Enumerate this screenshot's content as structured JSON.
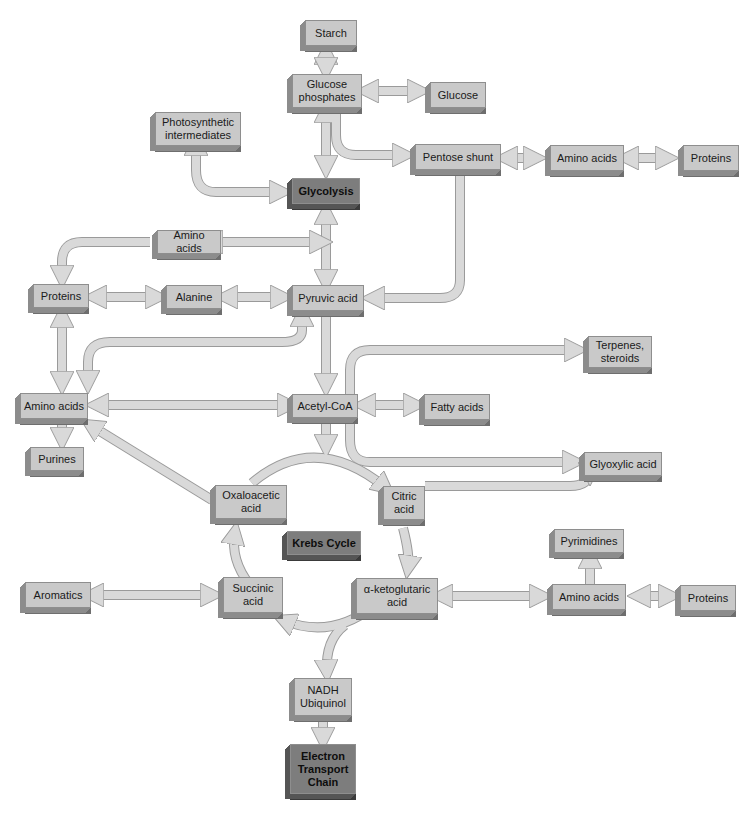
{
  "diagram": {
    "type": "metabolic-pathway-flowchart",
    "colors": {
      "box_fill": "#c9c9c9",
      "box_fill_highlight": "#7d7d7d",
      "arrow_fill": "#d9d9d9",
      "arrow_stroke": "#9a9a9a"
    },
    "nodes": {
      "starch": "Starch",
      "glucose_phosphates": "Glucose\nphosphates",
      "glucose": "Glucose",
      "photosynthetic_intermediates": "Photosynthetic\nintermediates",
      "glycolysis": "Glycolysis",
      "pentose_shunt": "Pentose shunt",
      "amino_acids_top": "Amino acids",
      "proteins_top": "Proteins",
      "amino_acids_mid": "Amino acids",
      "proteins_left": "Proteins",
      "alanine": "Alanine",
      "pyruvic_acid": "Pyruvic acid",
      "terpenes_steroids": "Terpenes,\nsteroids",
      "amino_acids_left": "Amino acids",
      "acetyl_coa": "Acetyl-CoA",
      "fatty_acids": "Fatty acids",
      "purines": "Purines",
      "glyoxylic_acid": "Glyoxylic acid",
      "oxaloacetic_acid": "Oxaloacetic\nacid",
      "citric_acid": "Citric\nacid",
      "krebs_cycle": "Krebs Cycle",
      "pyrimidines": "Pyrimidines",
      "aromatics": "Aromatics",
      "succinic_acid": "Succinic\nacid",
      "alpha_ketoglutaric_acid": "α-ketoglutaric\nacid",
      "amino_acids_right": "Amino acids",
      "proteins_right": "Proteins",
      "nadh_ubiquinol": "NADH\nUbiquinol",
      "electron_transport_chain": "Electron\nTransport\nChain"
    },
    "edges": [
      {
        "from": "Starch",
        "to": "Glucose phosphates",
        "dir": "both"
      },
      {
        "from": "Glucose phosphates",
        "to": "Glucose",
        "dir": "both"
      },
      {
        "from": "Glucose phosphates",
        "to": "Glycolysis",
        "dir": "both"
      },
      {
        "from": "Glucose phosphates",
        "to": "Pentose shunt",
        "dir": "forward"
      },
      {
        "from": "Photosynthetic intermediates",
        "to": "Glycolysis",
        "dir": "both"
      },
      {
        "from": "Pentose shunt",
        "to": "Amino acids",
        "dir": "both"
      },
      {
        "from": "Amino acids",
        "to": "Proteins",
        "dir": "both"
      },
      {
        "from": "Pentose shunt",
        "to": "Pyruvic acid",
        "dir": "forward"
      },
      {
        "from": "Glycolysis",
        "to": "Pyruvic acid",
        "dir": "both"
      },
      {
        "from": "Amino acids (mid)",
        "to": "Glycolysis/Pyruvic axis",
        "dir": "both"
      },
      {
        "from": "Amino acids (mid)",
        "to": "Proteins (left)",
        "dir": "forward"
      },
      {
        "from": "Proteins (left)",
        "to": "Alanine",
        "dir": "both"
      },
      {
        "from": "Alanine",
        "to": "Pyruvic acid",
        "dir": "both"
      },
      {
        "from": "Proteins (left)",
        "to": "Amino acids (left)",
        "dir": "both"
      },
      {
        "from": "Pyruvic acid",
        "to": "Amino acids (left)",
        "dir": "both"
      },
      {
        "from": "Pyruvic acid",
        "to": "Acetyl-CoA",
        "dir": "forward"
      },
      {
        "from": "Acetyl-CoA",
        "to": "Amino acids (left)",
        "dir": "both"
      },
      {
        "from": "Acetyl-CoA",
        "to": "Fatty acids",
        "dir": "both"
      },
      {
        "from": "Acetyl-CoA",
        "to": "Terpenes, steroids",
        "dir": "forward"
      },
      {
        "from": "Acetyl-CoA",
        "to": "Glyoxylic acid",
        "dir": "forward"
      },
      {
        "from": "Amino acids (left)",
        "to": "Purines",
        "dir": "forward"
      },
      {
        "from": "Oxaloacetic acid",
        "to": "Amino acids (left)",
        "dir": "forward"
      },
      {
        "from": "Acetyl-CoA",
        "to": "Krebs Cycle",
        "dir": "forward"
      },
      {
        "from": "Oxaloacetic acid",
        "to": "Citric acid",
        "dir": "forward"
      },
      {
        "from": "Citric acid",
        "to": "Glyoxylic acid",
        "dir": "forward"
      },
      {
        "from": "Citric acid",
        "to": "α-ketoglutaric acid",
        "dir": "forward"
      },
      {
        "from": "α-ketoglutaric acid",
        "to": "Succinic acid",
        "dir": "forward"
      },
      {
        "from": "Succinic acid",
        "to": "Oxaloacetic acid",
        "dir": "forward"
      },
      {
        "from": "Aromatics",
        "to": "Succinic acid",
        "dir": "both"
      },
      {
        "from": "α-ketoglutaric acid",
        "to": "Amino acids (right)",
        "dir": "both"
      },
      {
        "from": "Amino acids (right)",
        "to": "Pyrimidines",
        "dir": "forward"
      },
      {
        "from": "Amino acids (right)",
        "to": "Proteins (right)",
        "dir": "both"
      },
      {
        "from": "Krebs Cycle",
        "to": "NADH Ubiquinol",
        "dir": "forward"
      },
      {
        "from": "NADH Ubiquinol",
        "to": "Electron Transport Chain",
        "dir": "forward"
      }
    ]
  }
}
